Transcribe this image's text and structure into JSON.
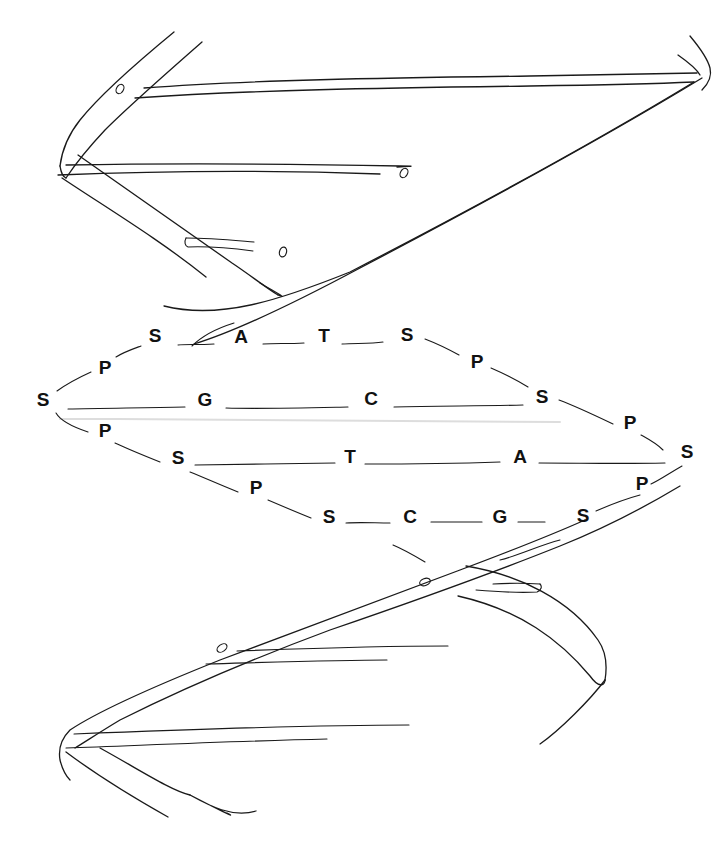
{
  "diagram": {
    "line_color": "#1a1a1a",
    "background": "#ffffff",
    "labels": [
      {
        "text": "S",
        "x": 155,
        "y": 335,
        "role": "sugar"
      },
      {
        "text": "A",
        "x": 241,
        "y": 336,
        "role": "base"
      },
      {
        "text": "T",
        "x": 324,
        "y": 335,
        "role": "base"
      },
      {
        "text": "S",
        "x": 407,
        "y": 334,
        "role": "sugar"
      },
      {
        "text": "P",
        "x": 105,
        "y": 367,
        "role": "phosphate"
      },
      {
        "text": "P",
        "x": 477,
        "y": 361,
        "role": "phosphate"
      },
      {
        "text": "S",
        "x": 43,
        "y": 399,
        "role": "sugar"
      },
      {
        "text": "G",
        "x": 205,
        "y": 399,
        "role": "base"
      },
      {
        "text": "C",
        "x": 371,
        "y": 398,
        "role": "base"
      },
      {
        "text": "S",
        "x": 542,
        "y": 396,
        "role": "sugar"
      },
      {
        "text": "P",
        "x": 105,
        "y": 430,
        "role": "phosphate"
      },
      {
        "text": "P",
        "x": 630,
        "y": 422,
        "role": "phosphate"
      },
      {
        "text": "S",
        "x": 178,
        "y": 457,
        "role": "sugar"
      },
      {
        "text": "T",
        "x": 350,
        "y": 456,
        "role": "base"
      },
      {
        "text": "A",
        "x": 520,
        "y": 456,
        "role": "base"
      },
      {
        "text": "S",
        "x": 687,
        "y": 451,
        "role": "sugar"
      },
      {
        "text": "P",
        "x": 256,
        "y": 487,
        "role": "phosphate"
      },
      {
        "text": "P",
        "x": 642,
        "y": 483,
        "role": "phosphate"
      },
      {
        "text": "S",
        "x": 329,
        "y": 516,
        "role": "sugar"
      },
      {
        "text": "C",
        "x": 410,
        "y": 516,
        "role": "base"
      },
      {
        "text": "G",
        "x": 500,
        "y": 516,
        "role": "base"
      },
      {
        "text": "S",
        "x": 583,
        "y": 515,
        "role": "sugar"
      }
    ]
  }
}
